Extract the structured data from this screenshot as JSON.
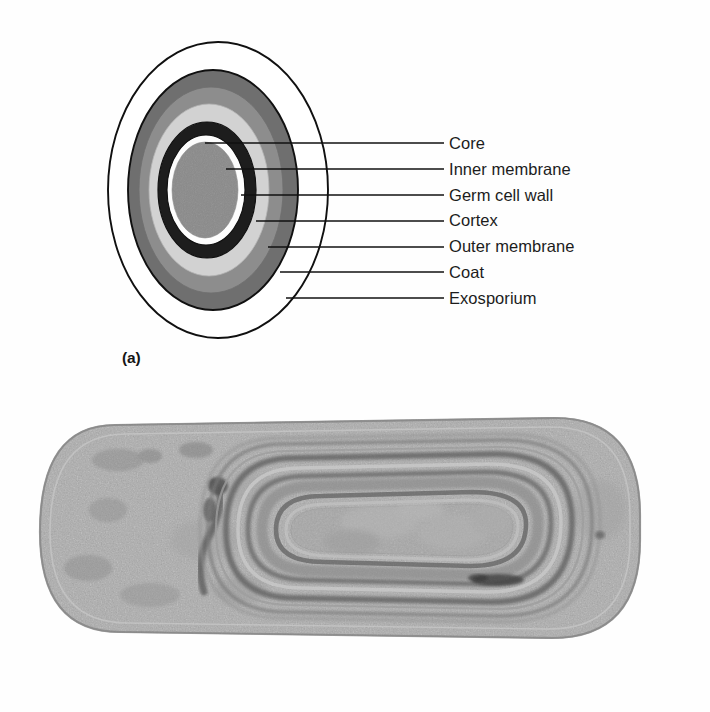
{
  "figure": {
    "panel_a_label": "(a)",
    "panel_b_label": "(b)",
    "panel_a_kind": "schematic-cross-section",
    "panel_b_kind": "transmission-electron-micrograph"
  },
  "callouts": [
    {
      "label": "Core",
      "layer_id": "core",
      "fill": "#8a8a8a"
    },
    {
      "label": "Inner membrane",
      "layer_id": "inner-membrane",
      "fill": "#fdfdfd"
    },
    {
      "label": "Germ cell wall",
      "layer_id": "germ-cell-wall",
      "fill": "#1d1d1d"
    },
    {
      "label": "Cortex",
      "layer_id": "cortex",
      "fill": "#d2d2d2"
    },
    {
      "label": "Outer membrane",
      "layer_id": "outer-membrane",
      "fill": "#8d8d8d"
    },
    {
      "label": "Coat",
      "layer_id": "coat",
      "fill": "#6f6f6f"
    },
    {
      "label": "Exosporium",
      "layer_id": "exosporium",
      "fill": "#ffffff"
    }
  ],
  "palette": {
    "stroke": "#101010",
    "core": "#8a8a8a",
    "inner_membrane": "#fdfdfd",
    "germ_cell_wall": "#1d1d1d",
    "cortex": "#d2d2d2",
    "outer_membrane": "#8d8d8d",
    "coat": "#6f6f6f",
    "exosporium": "#ffffff",
    "page": "#fefefe",
    "micrograph_light": "#bdbdbd",
    "micrograph_mid": "#9a9a9a",
    "micrograph_dark": "#6a6a6a"
  },
  "bleed_through": {
    "line_1": "",
    "line_2": ""
  }
}
